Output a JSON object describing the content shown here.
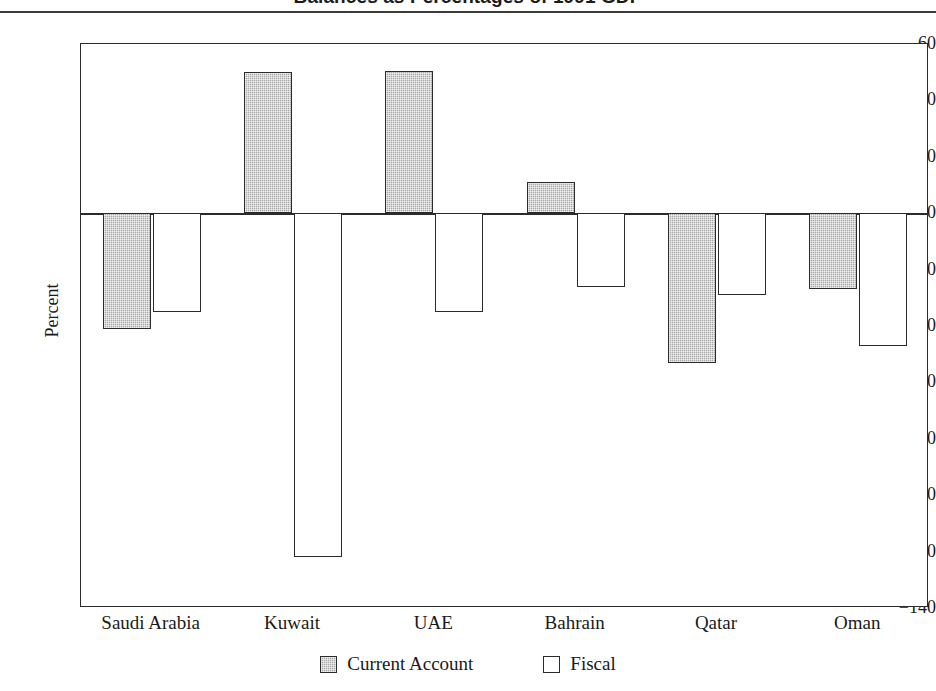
{
  "chart_data": {
    "type": "bar",
    "title": "Balances as Percentages of 1991 GDP",
    "xlabel": "",
    "ylabel": "Percent",
    "ylim": [
      -140,
      60
    ],
    "ytick_step": 20,
    "yticks": [
      "60",
      "40",
      "20",
      "0",
      "−20",
      "−40",
      "−60",
      "−80",
      "−100",
      "−120",
      "−140"
    ],
    "ytick_values": [
      60,
      40,
      20,
      0,
      -20,
      -40,
      -60,
      -80,
      -100,
      -120,
      -140
    ],
    "categories": [
      "Saudi Arabia",
      "Kuwait",
      "UAE",
      "Bahrain",
      "Qatar",
      "Oman"
    ],
    "series": [
      {
        "name": "Current Account",
        "color": "#a8a8a8",
        "fill": "stippled-gray",
        "values": [
          -41,
          50,
          50.5,
          11,
          -53,
          -27
        ]
      },
      {
        "name": "Fiscal",
        "color": "#ffffff",
        "fill": "white-outline",
        "values": [
          -35,
          -122,
          -35,
          -26,
          -29,
          -47
        ]
      }
    ],
    "grid": false,
    "legend_position": "bottom-center",
    "frame": true
  },
  "legend": {
    "items": [
      {
        "label": "Current Account",
        "swatch": "stippled-gray-swatch"
      },
      {
        "label": "Fiscal",
        "swatch": "white-outline-swatch"
      }
    ]
  }
}
